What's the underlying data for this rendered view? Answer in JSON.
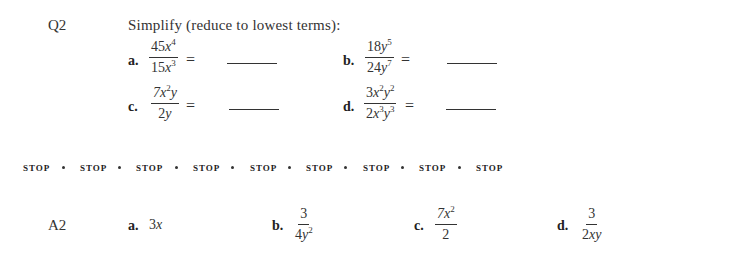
{
  "question": {
    "label": "Q2",
    "instruction": "Simplify (reduce to lowest terms):",
    "parts": [
      {
        "label": "a.",
        "numerator": {
          "coef": "45",
          "terms": [
            {
              "var": "x",
              "exp": "4"
            }
          ]
        },
        "denominator": {
          "coef": "15",
          "terms": [
            {
              "var": "x",
              "exp": "3"
            }
          ]
        },
        "equals": "="
      },
      {
        "label": "b.",
        "numerator": {
          "coef": "18",
          "terms": [
            {
              "var": "y",
              "exp": "5"
            }
          ]
        },
        "denominator": {
          "coef": "24",
          "terms": [
            {
              "var": "y",
              "exp": "7"
            }
          ]
        },
        "equals": "="
      },
      {
        "label": "c.",
        "numerator": {
          "coef": "7",
          "terms": [
            {
              "var": "x",
              "exp": "2"
            },
            {
              "var": "y",
              "exp": ""
            }
          ]
        },
        "denominator": {
          "coef": "2",
          "terms": [
            {
              "var": "y",
              "exp": ""
            }
          ]
        },
        "equals": "="
      },
      {
        "label": "d.",
        "numerator": {
          "coef": "3",
          "terms": [
            {
              "var": "x",
              "exp": "2"
            },
            {
              "var": "y",
              "exp": "2"
            }
          ]
        },
        "denominator": {
          "coef": "2",
          "terms": [
            {
              "var": "x",
              "exp": "3"
            },
            {
              "var": "y",
              "exp": "3"
            }
          ]
        },
        "equals": "="
      }
    ]
  },
  "stop_row": {
    "word": "STOP",
    "count": 9,
    "items": [
      "STOP",
      "STOP",
      "STOP",
      "STOP",
      "STOP",
      "STOP",
      "STOP",
      "STOP",
      "STOP"
    ]
  },
  "answer": {
    "label": "A2",
    "parts": [
      {
        "label": "a.",
        "coef": "3",
        "var": "x"
      },
      {
        "label": "b.",
        "numerator": "3",
        "den_coef": "4",
        "den_var": "y",
        "den_exp": "2"
      },
      {
        "label": "c.",
        "num_coef": "7",
        "num_var": "x",
        "num_exp": "2",
        "denominator": "2"
      },
      {
        "label": "d.",
        "numerator": "3",
        "den_coef": "2",
        "den_var": "xy"
      }
    ]
  }
}
